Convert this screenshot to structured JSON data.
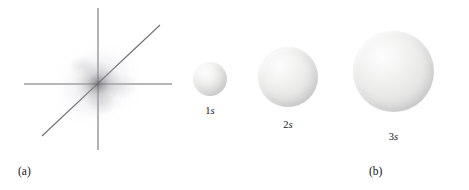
{
  "figure": {
    "background_color": "#ffffff",
    "width": 469,
    "height": 190
  },
  "panel_a": {
    "caption": "(a)",
    "description": "three-dimensional cartesian axes with a diffuse electron probability density cloud concentrated at the origin",
    "axis_color": "#6e6e72",
    "cloud_color": "#78787e",
    "origin": {
      "x": 98,
      "y": 84
    },
    "axes": [
      {
        "name": "horizontal-axis",
        "x1": 24,
        "y1": 84,
        "x2": 172,
        "y2": 84
      },
      {
        "name": "vertical-axis",
        "x1": 98,
        "y1": 8,
        "x2": 98,
        "y2": 150
      },
      {
        "name": "diagonal-axis",
        "x1": 42,
        "y1": 136,
        "x2": 160,
        "y2": 25
      }
    ]
  },
  "panel_b": {
    "caption": "(b)",
    "description": "relative sizes of the 1s, 2s and 3s orbital boundary-surface spheres",
    "sphere_fill": "#e9e9e7",
    "sphere_highlight": "#fdfdfd",
    "sphere_shadow": "#cfcfcf",
    "orbitals": [
      {
        "shell": "1",
        "subshell": "s",
        "diameter": 34,
        "left": 13,
        "top": 62,
        "label_top": 106
      },
      {
        "shell": "2",
        "subshell": "s",
        "diameter": 60,
        "left": 78,
        "top": 47,
        "label_top": 120
      },
      {
        "shell": "3",
        "subshell": "s",
        "diameter": 81,
        "left": 173,
        "top": 31,
        "label_top": 132
      }
    ]
  }
}
